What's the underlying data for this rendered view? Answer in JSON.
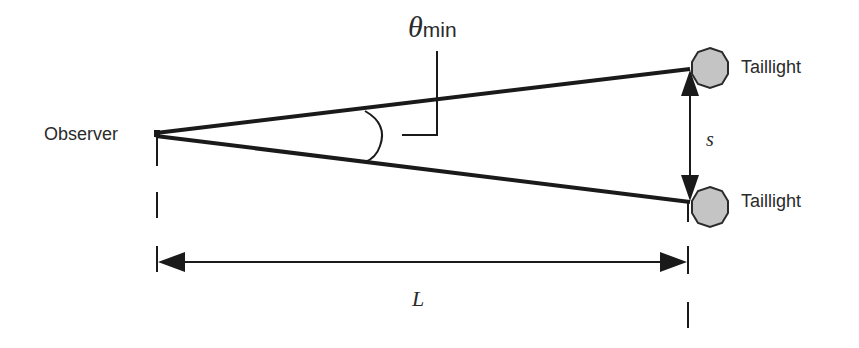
{
  "diagram": {
    "type": "geometry-angle-resolution",
    "labels": {
      "observer": "Observer",
      "taillight_top": "Taillight",
      "taillight_bottom": "Taillight",
      "theta_symbol": "θ",
      "theta_subscript": "min",
      "separation": "s",
      "distance": "L"
    },
    "colors": {
      "line": "#1a1a1a",
      "taillight_fill": "#c4c4c4",
      "taillight_stroke": "#2a2a2a",
      "text": "#2a2a2a",
      "background": "#ffffff"
    }
  }
}
